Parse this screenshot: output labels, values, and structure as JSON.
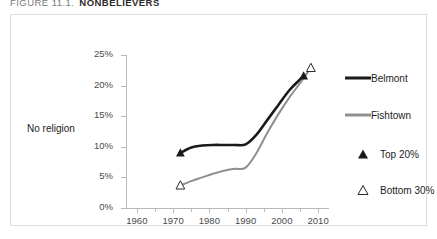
{
  "figure": {
    "caption_number": "FIGURE 11.1.",
    "caption_title": "NONBELIEVERS"
  },
  "colors": {
    "belmont": "#1a1a1a",
    "fishtown": "#8f8f8f",
    "axis": "#b9b9b9",
    "frame": "#dedede",
    "text": "#4a4a4a"
  },
  "legend": {
    "position": "right",
    "items": [
      {
        "label": "Belmont",
        "glyph": "line",
        "color": "#1a1a1a"
      },
      {
        "label": "Fishtown",
        "glyph": "line",
        "color": "#8f8f8f"
      },
      {
        "label": "Top 20%",
        "glyph": "filled-triangle",
        "color": "#1a1a1a"
      },
      {
        "label": "Bottom 30%",
        "glyph": "open-triangle",
        "color": "#1a1a1a"
      }
    ]
  },
  "chart_data": {
    "type": "line",
    "title": "NONBELIEVERS",
    "xlabel": "",
    "ylabel": "No religion",
    "xlim": [
      1957,
      2013
    ],
    "ylim": [
      0,
      25
    ],
    "ytick_labels": [
      "0%",
      "5%",
      "10%",
      "15%",
      "20%",
      "25%"
    ],
    "ytick_values": [
      0,
      5,
      10,
      15,
      20,
      25
    ],
    "xtick_labels": [
      "1960",
      "1970",
      "1980",
      "1990",
      "2000",
      "2010"
    ],
    "xtick_values": [
      1960,
      1970,
      1980,
      1990,
      2000,
      2010
    ],
    "xtick_minor_values": [
      1965,
      1975,
      1985,
      1995,
      2005
    ],
    "grid": false,
    "series": [
      {
        "name": "Belmont",
        "color": "#1a1a1a",
        "marker_start": "filled-triangle",
        "marker_end": "filled-triangle",
        "x": [
          1972,
          1975,
          1978,
          1981,
          1984,
          1987,
          1990,
          1993,
          1996,
          1999,
          2002,
          2005,
          2006
        ],
        "values": [
          9.0,
          9.9,
          10.2,
          10.3,
          10.3,
          10.3,
          10.4,
          12.0,
          14.4,
          16.8,
          19.2,
          21.0,
          21.6
        ]
      },
      {
        "name": "Fishtown",
        "color": "#8f8f8f",
        "marker_start": "open-triangle",
        "marker_end": "open-triangle",
        "x": [
          1972,
          1975,
          1978,
          1981,
          1984,
          1987,
          1990,
          1993,
          1996,
          1999,
          2002,
          2005,
          2008
        ],
        "values": [
          3.7,
          4.4,
          5.0,
          5.6,
          6.1,
          6.4,
          6.6,
          9.0,
          12.3,
          15.3,
          18.0,
          20.4,
          22.9
        ]
      }
    ],
    "annotations": [
      {
        "text": "Top 20%",
        "series": "Belmont",
        "marker": "filled-triangle"
      },
      {
        "text": "Bottom 30%",
        "series": "Fishtown",
        "marker": "open-triangle"
      }
    ]
  }
}
